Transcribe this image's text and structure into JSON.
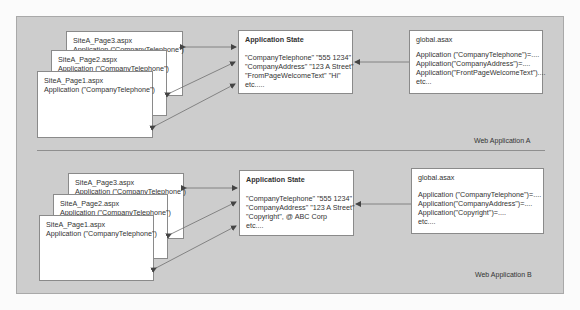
{
  "sections": [
    {
      "label": "Web Application A",
      "pages": [
        {
          "name": "SiteA_Page3.aspx",
          "code": "Application (\"CompanyTelephone\")"
        },
        {
          "name": "SiteA_Page2.aspx",
          "code": "Application (\"CompanyTelephone\")"
        },
        {
          "name": "SiteA_Page1.aspx",
          "code": "Application (\"CompanyTelephone\")"
        }
      ],
      "app_state": {
        "title": "Application State",
        "lines": [
          "\"CompanyTelephone\" \"555 1234\"",
          "\"CompanyAddress\" \"123 A Street\"",
          "\"FromPageWelcomeText\" \"Hi\"",
          "etc....."
        ]
      },
      "global": {
        "title": "global.asax",
        "lines": [
          "Application (\"CompanyTelephone\")=....",
          "Application(\"CompanyAddress\")=....",
          "Application(\"FrontPageWelcomeText\")....",
          "etc..."
        ]
      }
    },
    {
      "label": "Web Application B",
      "pages": [
        {
          "name": "SiteA_Page3.aspx",
          "code": "Application (\"CompanyTelephone\")"
        },
        {
          "name": "SiteA_Page2.aspx",
          "code": "Application (\"CompanyTelephone\")"
        },
        {
          "name": "SiteA_Page1.aspx",
          "code": "Application (\"CompanyTelephone\")"
        }
      ],
      "app_state": {
        "title": "Application State",
        "lines": [
          "\"CompanyTelephone\" \"555 1234\"",
          "\"CompanyAddress\" \"123 A Street\"",
          "\"Copyright\", @ ABC Corp",
          "etc...."
        ]
      },
      "global": {
        "title": "global.asax",
        "lines": [
          "Application (\"CompanyTelephone\")=....",
          "Application(\"CompanyAddress\")=....",
          "Application(\"Copyright\")=....",
          "etc...."
        ]
      }
    }
  ],
  "colors": {
    "panel": "#cdcdcd",
    "box": "#ffffff",
    "line": "#707070"
  }
}
